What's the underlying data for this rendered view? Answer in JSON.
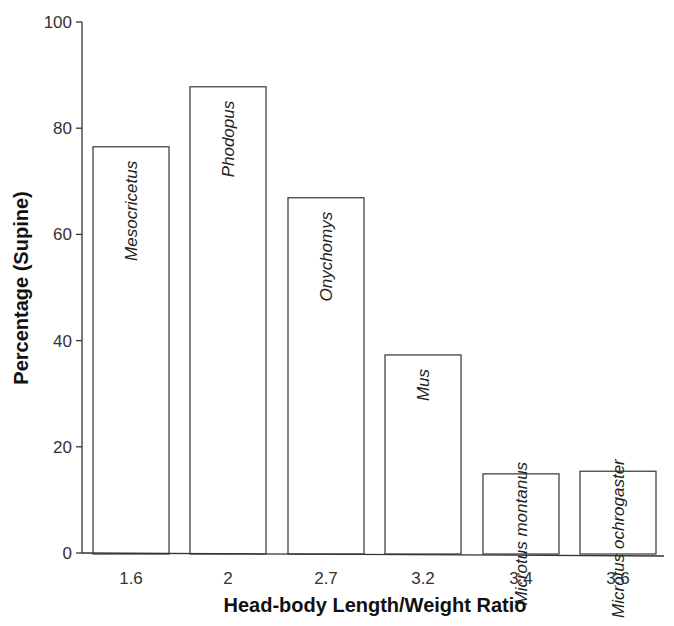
{
  "chart_data": {
    "type": "bar",
    "title": "",
    "xlabel": "Head-body Length/Weight Ratio",
    "ylabel": "Percentage (Supine)",
    "ylim": [
      0,
      100
    ],
    "yticks": [
      0,
      20,
      40,
      60,
      80,
      100
    ],
    "grid": false,
    "legend": null,
    "categories": [
      "1.6",
      "2",
      "2.7",
      "3.2",
      "3.4",
      "3.6"
    ],
    "bar_labels": [
      "Mesocricetus",
      "Phodopus",
      "Onychomys",
      "Mus",
      "Microtus montanus",
      "Microtus ochrogaster"
    ],
    "values": [
      76.5,
      87.8,
      66.9,
      37.3,
      14.9,
      15.4
    ]
  }
}
